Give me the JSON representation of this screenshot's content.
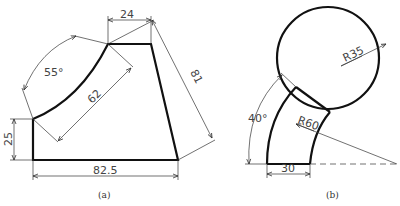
{
  "figure_a": {
    "caption": "(a)",
    "dimensions": {
      "top_width": "24",
      "slant": "81",
      "angle": "55°",
      "radius_chord": "62",
      "left_height": "25",
      "bottom_width": "82.5"
    }
  },
  "figure_b": {
    "caption": "(b)",
    "dimensions": {
      "circle_radius": "R35",
      "arc_radius": "R60",
      "angle": "40°",
      "band_width": "30"
    }
  },
  "colors": {
    "line": "#111111",
    "dimension": "#444444",
    "background": "#ffffff"
  }
}
